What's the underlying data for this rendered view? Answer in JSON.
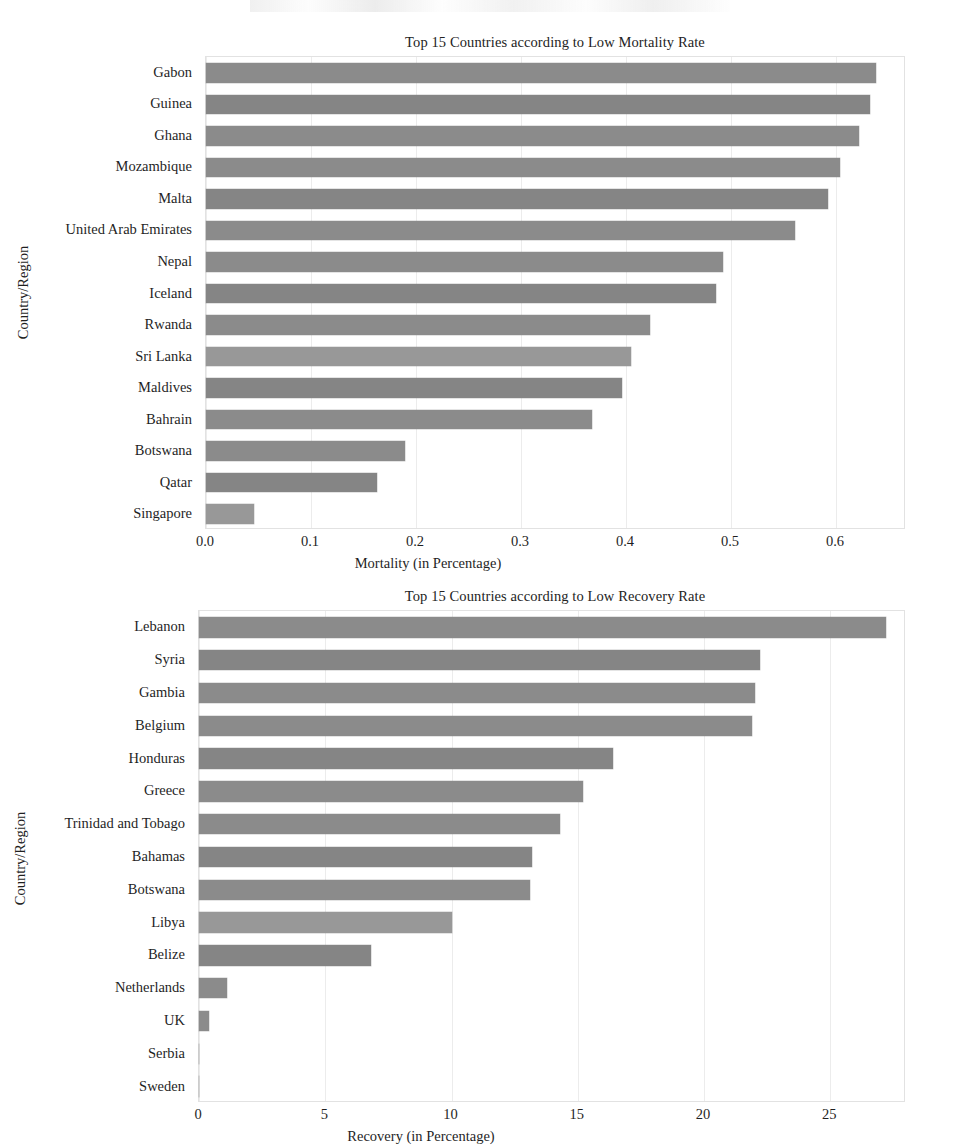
{
  "page": {
    "background": "#ffffff",
    "bar_color": "#8b8b8b",
    "grid_color": "#ececec",
    "text_color": "#1f1f1f"
  },
  "chart_data": [
    {
      "id": "mortality",
      "type": "bar",
      "orientation": "horizontal",
      "title": "Top 15 Countries according to Low Mortality Rate",
      "xlabel": "Mortality (in Percentage)",
      "ylabel": "Country/Region",
      "xlim": [
        0.0,
        0.6667
      ],
      "xticks": [
        "0.0",
        "0.1",
        "0.2",
        "0.3",
        "0.4",
        "0.5",
        "0.6"
      ],
      "xtick_values": [
        0.0,
        0.1,
        0.2,
        0.3,
        0.4,
        0.5,
        0.6
      ],
      "grid": true,
      "legend": "none",
      "categories": [
        "Gabon",
        "Guinea",
        "Ghana",
        "Mozambique",
        "Malta",
        "United Arab Emirates",
        "Nepal",
        "Iceland",
        "Rwanda",
        "Sri Lanka",
        "Maldives",
        "Bahrain",
        "Botswana",
        "Qatar",
        "Singapore"
      ],
      "values": [
        0.638,
        0.632,
        0.622,
        0.604,
        0.592,
        0.561,
        0.492,
        0.486,
        0.423,
        0.405,
        0.396,
        0.368,
        0.19,
        0.163,
        0.046
      ]
    },
    {
      "id": "recovery",
      "type": "bar",
      "orientation": "horizontal",
      "title": "Top 15 Countries according to Low Recovery Rate",
      "xlabel": "Recovery (in Percentage)",
      "ylabel": "Country/Region",
      "xlim": [
        0,
        28
      ],
      "xticks": [
        "0",
        "5",
        "10",
        "15",
        "20",
        "25"
      ],
      "xtick_values": [
        0,
        5,
        10,
        15,
        20,
        25
      ],
      "grid": true,
      "legend": "none",
      "categories": [
        "Lebanon",
        "Syria",
        "Gambia",
        "Belgium",
        "Honduras",
        "Greece",
        "Trinidad and Tobago",
        "Bahamas",
        "Botswana",
        "Libya",
        "Belize",
        "Netherlands",
        "UK",
        "Serbia",
        "Sweden"
      ],
      "values": [
        27.2,
        22.2,
        22.0,
        21.9,
        16.4,
        15.2,
        14.3,
        13.2,
        13.1,
        10.0,
        6.8,
        1.1,
        0.4,
        0.0,
        0.0
      ]
    }
  ]
}
